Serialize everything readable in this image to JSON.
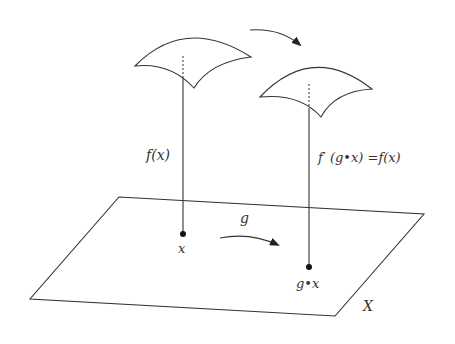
{
  "diagram": {
    "type": "fiber-bundle-group-action",
    "colors": {
      "line": "#333333",
      "background": "#ffffff"
    },
    "labels": {
      "fiber_left": "f(x)",
      "fiber_right": "f′ (g•x) =f(x)",
      "point_left": "x",
      "point_right": "g•x",
      "action": "g",
      "space": "X"
    },
    "elements": {
      "base_space": "plane X",
      "left_fiber": "surface over x",
      "right_fiber": "surface over g•x",
      "top_arrow": "maps left surface to right surface",
      "bottom_arrow": "g acts on x"
    }
  }
}
